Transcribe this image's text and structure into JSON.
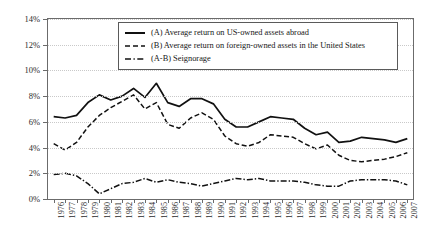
{
  "chart_data": {
    "type": "line",
    "title": "",
    "xlabel": "",
    "ylabel": "",
    "ylim": [
      0,
      14
    ],
    "ytick_labels": [
      "0%",
      "2%",
      "4%",
      "6%",
      "8%",
      "10%",
      "12%",
      "14%"
    ],
    "ytick_values": [
      0,
      2,
      4,
      6,
      8,
      10,
      12,
      14
    ],
    "grid": true,
    "legend_position": "top-right-inside",
    "x": [
      1976,
      1977,
      1978,
      1979,
      1980,
      1981,
      1982,
      1983,
      1984,
      1985,
      1986,
      1987,
      1988,
      1989,
      1990,
      1991,
      1992,
      1993,
      1994,
      1995,
      1996,
      1997,
      1998,
      1999,
      2000,
      2001,
      2002,
      2003,
      2004,
      2005,
      2006,
      2007
    ],
    "categories": [
      "1976",
      "1977",
      "1978",
      "1979",
      "1980",
      "1981",
      "1982",
      "1983",
      "1984",
      "1985",
      "1986",
      "1987",
      "1988",
      "1989",
      "1990",
      "1991",
      "1992",
      "1993",
      "1994",
      "1995",
      "1996",
      "1997",
      "1998",
      "1999",
      "2000",
      "2001",
      "2002",
      "2003",
      "2004",
      "2005",
      "2006",
      "2007"
    ],
    "series": [
      {
        "name": "(A) Average return on US-owned assets abroad",
        "style": "solid",
        "color": "#111111",
        "values": [
          6.4,
          6.3,
          6.5,
          7.5,
          8.1,
          7.7,
          8.0,
          8.6,
          7.9,
          9.0,
          7.5,
          7.2,
          7.8,
          7.8,
          7.4,
          6.2,
          5.6,
          5.6,
          6.0,
          6.4,
          6.3,
          6.2,
          5.5,
          5.0,
          5.2,
          4.4,
          4.5,
          4.8,
          4.7,
          4.6,
          4.4,
          4.7
        ]
      },
      {
        "name": "(B) Average return on foreign-owned assets in the United States",
        "style": "dashed",
        "color": "#111111",
        "values": [
          4.3,
          3.8,
          4.4,
          5.6,
          6.5,
          7.1,
          7.6,
          8.1,
          7.0,
          7.5,
          5.8,
          5.5,
          6.3,
          6.7,
          6.2,
          4.9,
          4.3,
          4.1,
          4.4,
          5.0,
          4.9,
          4.8,
          4.3,
          3.9,
          4.2,
          3.4,
          3.0,
          2.9,
          3.0,
          3.1,
          3.3,
          3.6
        ]
      },
      {
        "name": "(A-B) Seignorage",
        "style": "dashdot",
        "color": "#111111",
        "values": [
          1.9,
          2.0,
          1.8,
          1.2,
          0.4,
          0.8,
          1.2,
          1.3,
          1.6,
          1.3,
          1.5,
          1.3,
          1.2,
          1.0,
          1.2,
          1.4,
          1.6,
          1.5,
          1.6,
          1.4,
          1.4,
          1.4,
          1.3,
          1.1,
          1.0,
          1.0,
          1.4,
          1.5,
          1.5,
          1.5,
          1.4,
          1.1
        ]
      }
    ]
  },
  "legend": {
    "items": [
      {
        "label": "(A) Average return on US-owned assets abroad",
        "style": "solid"
      },
      {
        "label": "(B) Average return on foreign-owned assets in the United States",
        "style": "dashed"
      },
      {
        "label": "(A-B) Seignorage",
        "style": "dashdot"
      }
    ]
  }
}
